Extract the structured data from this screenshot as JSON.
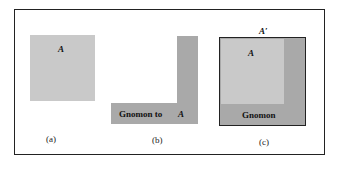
{
  "figure": {
    "colors": {
      "square": "#c9c9c9",
      "gnomon": "#a9a9a9",
      "border": "#222222"
    },
    "panel_a": {
      "square_label": "A",
      "caption": "(a)"
    },
    "panel_b": {
      "gnomon_label": "Gnomon to",
      "square_ref": "A",
      "caption": "(b)"
    },
    "panel_c": {
      "outer_label": "A′",
      "square_label": "A",
      "gnomon_label": "Gnomon",
      "caption": "(c)"
    }
  }
}
